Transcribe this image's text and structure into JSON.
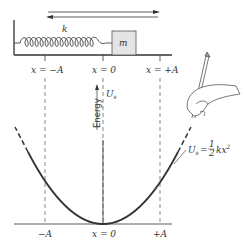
{
  "figure": {
    "spring_label": "k",
    "mass_label": "m",
    "top_ticks": [
      "x = −A",
      "x = 0",
      "x = +A"
    ],
    "bottom_ticks": [
      "−A",
      "x = 0",
      "+A"
    ],
    "y_axis_label": "Energy",
    "curve_label_top": "U",
    "curve_label_sub": "s",
    "equation": {
      "lhs": "U",
      "lhs_sub": "s",
      "eq": "=",
      "frac_num": "1",
      "frac_den": "2",
      "rhs": "kx",
      "rhs_exp": "2"
    },
    "colors": {
      "line": "#333333",
      "block_fill": "#e4e4e4",
      "dash": "#555555"
    }
  }
}
